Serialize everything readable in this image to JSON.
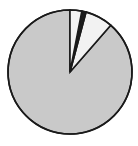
{
  "figure": {
    "name": "pie-chart-figure",
    "background": "#ffffff",
    "width": 138,
    "height": 146
  },
  "chart_data": {
    "type": "pie",
    "title": "",
    "subtitle": "",
    "xlabel": "",
    "ylabel": "",
    "grid": false,
    "legend": "none",
    "start_angle_deg": 0,
    "direction": "clockwise",
    "center": {
      "x": 70,
      "y": 72
    },
    "radius": 62,
    "stroke_color": "#1a1a1a",
    "stroke_width": 1.6,
    "labels": [
      "Slice 1",
      "Slice 2",
      "Slice 3",
      "Slice 4"
    ],
    "values": [
      88.6,
      7.2,
      1.1,
      3.1
    ],
    "percentages": [
      "88.6%",
      "7.2%",
      "1.1%",
      "3.1%"
    ],
    "angles_deg": [
      319.0,
      26.0,
      4.0,
      11.0
    ],
    "colors": [
      "#c9c9c9",
      "#f2f2f2",
      "#1c1c1c",
      "#f2f2f2"
    ],
    "slices": [
      {
        "label": "Slice 1",
        "value": 88.6,
        "percentage": "88.6%",
        "start_deg": 41.0,
        "end_deg": 360.0,
        "angle_deg": 319.0,
        "color": "#c9c9c9"
      },
      {
        "label": "Slice 2",
        "value": 7.2,
        "percentage": "7.2%",
        "start_deg": 15.0,
        "end_deg": 41.0,
        "angle_deg": 26.0,
        "color": "#f2f2f2"
      },
      {
        "label": "Slice 3",
        "value": 1.1,
        "percentage": "1.1%",
        "start_deg": 11.0,
        "end_deg": 15.0,
        "angle_deg": 4.0,
        "color": "#1c1c1c"
      },
      {
        "label": "Slice 4",
        "value": 3.1,
        "percentage": "3.1%",
        "start_deg": 0.0,
        "end_deg": 11.0,
        "angle_deg": 11.0,
        "color": "#f2f2f2"
      }
    ]
  }
}
